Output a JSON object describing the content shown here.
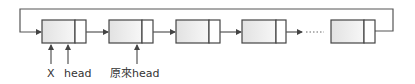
{
  "diagram": {
    "type": "circular-linked-list",
    "nodes": [
      {
        "id": "node-1",
        "x": 42,
        "w": 44,
        "divider": 75
      },
      {
        "id": "node-2",
        "x": 109,
        "w": 44,
        "divider": 142
      },
      {
        "id": "node-3",
        "x": 176,
        "w": 44,
        "divider": 209
      },
      {
        "id": "node-4",
        "x": 242,
        "w": 44,
        "divider": 276
      },
      {
        "id": "node-5",
        "x": 331,
        "w": 44,
        "divider": 364
      }
    ],
    "ellipsis": "......",
    "labels": {
      "x": "X",
      "head": "head",
      "original_head": "原來head"
    },
    "colors": {
      "stroke": "#444444",
      "fill_start": "#e6e6e6",
      "fill_end": "#fafafa"
    }
  }
}
